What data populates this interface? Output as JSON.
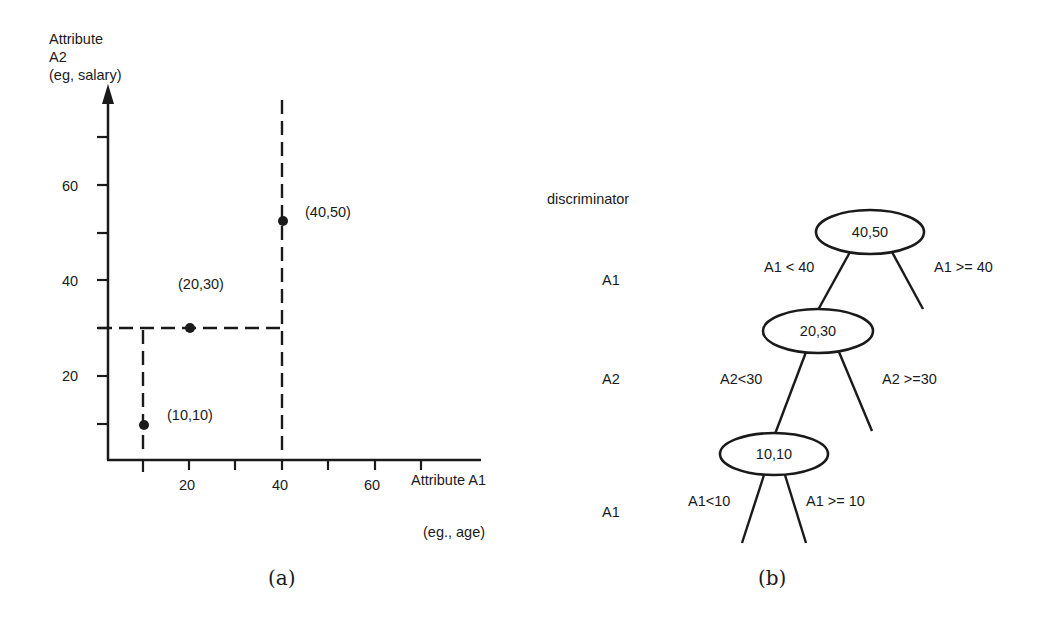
{
  "panel_a": {
    "caption": "(a)",
    "y_axis": {
      "label_lines": [
        "Attribute",
        "A2",
        "(eg, salary)"
      ],
      "ticks": [
        10,
        20,
        30,
        40,
        50,
        60,
        70
      ],
      "tick_labels": [
        "20",
        "40",
        "60"
      ]
    },
    "x_axis": {
      "label": "Attribute A1",
      "sublabel": "(eg., age)",
      "ticks": [
        10,
        20,
        30,
        40,
        50,
        60,
        70
      ],
      "tick_labels": [
        "20",
        "40",
        "60"
      ]
    },
    "points": [
      {
        "label": "(40,50)",
        "x": 40,
        "y": 50
      },
      {
        "label": "(20,30)",
        "x": 20,
        "y": 30
      },
      {
        "label": "(10,10)",
        "x": 10,
        "y": 10
      }
    ],
    "partition_lines": [
      {
        "orientation": "vertical",
        "at": 40,
        "from": 0,
        "to": 75
      },
      {
        "orientation": "horizontal",
        "at": 30,
        "from": 0,
        "to": 40
      },
      {
        "orientation": "vertical",
        "at": 10,
        "from": 0,
        "to": 30
      }
    ]
  },
  "panel_b": {
    "caption": "(b)",
    "discriminator_header": "discriminator",
    "discriminators": [
      "A1",
      "A2",
      "A1"
    ],
    "nodes": [
      {
        "label": "40,50",
        "left_edge": "A1 < 40",
        "right_edge": "A1 >= 40"
      },
      {
        "label": "20,30",
        "left_edge": "A2<30",
        "right_edge": "A2 >=30"
      },
      {
        "label": "10,10",
        "left_edge": "A1<10",
        "right_edge": "A1 >= 10"
      }
    ]
  }
}
